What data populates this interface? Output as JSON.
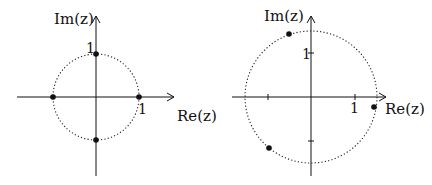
{
  "left_plot": {
    "x_label": "Re(z)",
    "y_label": "Im(z)",
    "x_tick": "1",
    "y_tick": "1",
    "circle": "unit circle (dotted)",
    "points": [
      [
        1,
        0
      ],
      [
        0,
        1
      ],
      [
        -1,
        0
      ],
      [
        0,
        -1
      ]
    ]
  },
  "right_plot": {
    "x_label": "Re(z)",
    "y_label": "Im(z)",
    "x_tick": "1",
    "y_tick": "1",
    "circle": "dotted circle, radius ≈ 1.5",
    "points": [
      [
        -0.5,
        1.45
      ],
      [
        1.45,
        -0.23
      ],
      [
        -0.95,
        -1.16
      ]
    ]
  }
}
